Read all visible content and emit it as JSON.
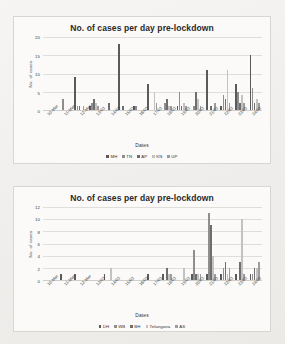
{
  "document": {
    "background_color": "#f2f1ef",
    "type": "scanned-figure-page"
  },
  "charts": [
    {
      "id": "top",
      "title": "No. of cases per day pre-lockdown",
      "xlabel": "Dates",
      "ylabel": "No. of cases",
      "yticks": [
        "0",
        "5",
        "10",
        "15",
        "20"
      ],
      "legend": [
        {
          "label": "MH",
          "color": "#5a5a5a"
        },
        {
          "label": "TN",
          "color": "#8e8e8e"
        },
        {
          "label": "AP",
          "color": "#6e6e6e"
        },
        {
          "label": "KN",
          "color": "#c2c2c2"
        },
        {
          "label": "UP",
          "color": "#9c9c9c"
        }
      ]
    },
    {
      "id": "bottom",
      "title": "No. of cases per day pre-lockdown",
      "xlabel": "Dates",
      "ylabel": "No. of cases",
      "yticks": [
        "0",
        "2",
        "4",
        "6",
        "8",
        "10",
        "12"
      ],
      "legend": [
        {
          "label": "DH",
          "color": "#5a5a5a"
        },
        {
          "label": "WB",
          "color": "#8e8e8e"
        },
        {
          "label": "BH",
          "color": "#6e6e6e"
        },
        {
          "label": "Telangana",
          "color": "#c2c2c2"
        },
        {
          "label": "AS",
          "color": "#9c9c9c"
        }
      ]
    }
  ],
  "chart_data": [
    {
      "type": "bar",
      "title": "No. of cases per day pre-lockdown",
      "xlabel": "Dates",
      "ylabel": "No. of cases",
      "ylim": [
        0,
        20
      ],
      "ytick_values": [
        0,
        5,
        10,
        15,
        20
      ],
      "grid": true,
      "legend_position": "bottom",
      "categories": [
        "10-Mar",
        "11-Mar",
        "12-Mar",
        "13/03",
        "14/03",
        "15/03",
        "16/03",
        "17/03",
        "18/03",
        "19/03",
        "20/03",
        "21/03",
        "22/03",
        "23/03",
        "24/03"
      ],
      "series": [
        {
          "name": "MH",
          "color": "#5a5a5a",
          "values": [
            0,
            0,
            9,
            1,
            0,
            18,
            1,
            7,
            0,
            1,
            0,
            11,
            1,
            7,
            15
          ]
        },
        {
          "name": "TN",
          "color": "#8e8e8e",
          "values": [
            0,
            3,
            1,
            2,
            0,
            0,
            1,
            0,
            2,
            5,
            1,
            0,
            4,
            5,
            6
          ]
        },
        {
          "name": "AP",
          "color": "#6e6e6e",
          "values": [
            0,
            0,
            1,
            3,
            2,
            1,
            0,
            0,
            3,
            1,
            5,
            1,
            3,
            2,
            2
          ]
        },
        {
          "name": "KN",
          "color": "#c2c2c2",
          "values": [
            0,
            0,
            0,
            2,
            0,
            0,
            0,
            5,
            1,
            2,
            3,
            0,
            11,
            4,
            3
          ]
        },
        {
          "name": "UP",
          "color": "#9c9c9c",
          "values": [
            0,
            0,
            1,
            1,
            0,
            0,
            0,
            2,
            1,
            1,
            1,
            2,
            2,
            2,
            2
          ]
        }
      ]
    },
    {
      "type": "bar",
      "title": "No. of cases per day pre-lockdown",
      "xlabel": "Dates",
      "ylabel": "No. of cases",
      "ylim": [
        0,
        12
      ],
      "ytick_values": [
        0,
        2,
        4,
        6,
        8,
        10,
        12
      ],
      "grid": true,
      "legend_position": "bottom",
      "categories": [
        "10-Mar",
        "11-Mar",
        "12-Mar",
        "13/03",
        "14/03",
        "15/03",
        "16/03",
        "17/03",
        "18/03",
        "19/03",
        "20/03",
        "21/03",
        "22/03",
        "23/03",
        "24/03"
      ],
      "series": [
        {
          "name": "DH",
          "color": "#5a5a5a",
          "values": [
            0,
            1,
            1,
            0,
            1,
            0,
            0,
            1,
            1,
            0,
            1,
            1,
            1,
            1,
            1
          ]
        },
        {
          "name": "WB",
          "color": "#8e8e8e",
          "values": [
            0,
            0,
            0,
            0,
            0,
            0,
            0,
            0,
            0,
            0,
            5,
            11,
            2,
            0,
            1
          ]
        },
        {
          "name": "BH",
          "color": "#6e6e6e",
          "values": [
            0,
            0,
            0,
            0,
            0,
            0,
            0,
            0,
            2,
            0,
            1,
            9,
            3,
            3,
            2
          ]
        },
        {
          "name": "Telangana",
          "color": "#c2c2c2",
          "values": [
            0,
            0,
            0,
            0,
            2,
            0,
            0,
            0,
            1,
            2,
            1,
            4,
            1,
            10,
            2
          ]
        },
        {
          "name": "AS",
          "color": "#9c9c9c",
          "values": [
            0,
            0,
            0,
            0,
            0,
            0,
            0,
            0,
            1,
            0,
            1,
            1,
            2,
            1,
            3
          ]
        }
      ]
    }
  ]
}
